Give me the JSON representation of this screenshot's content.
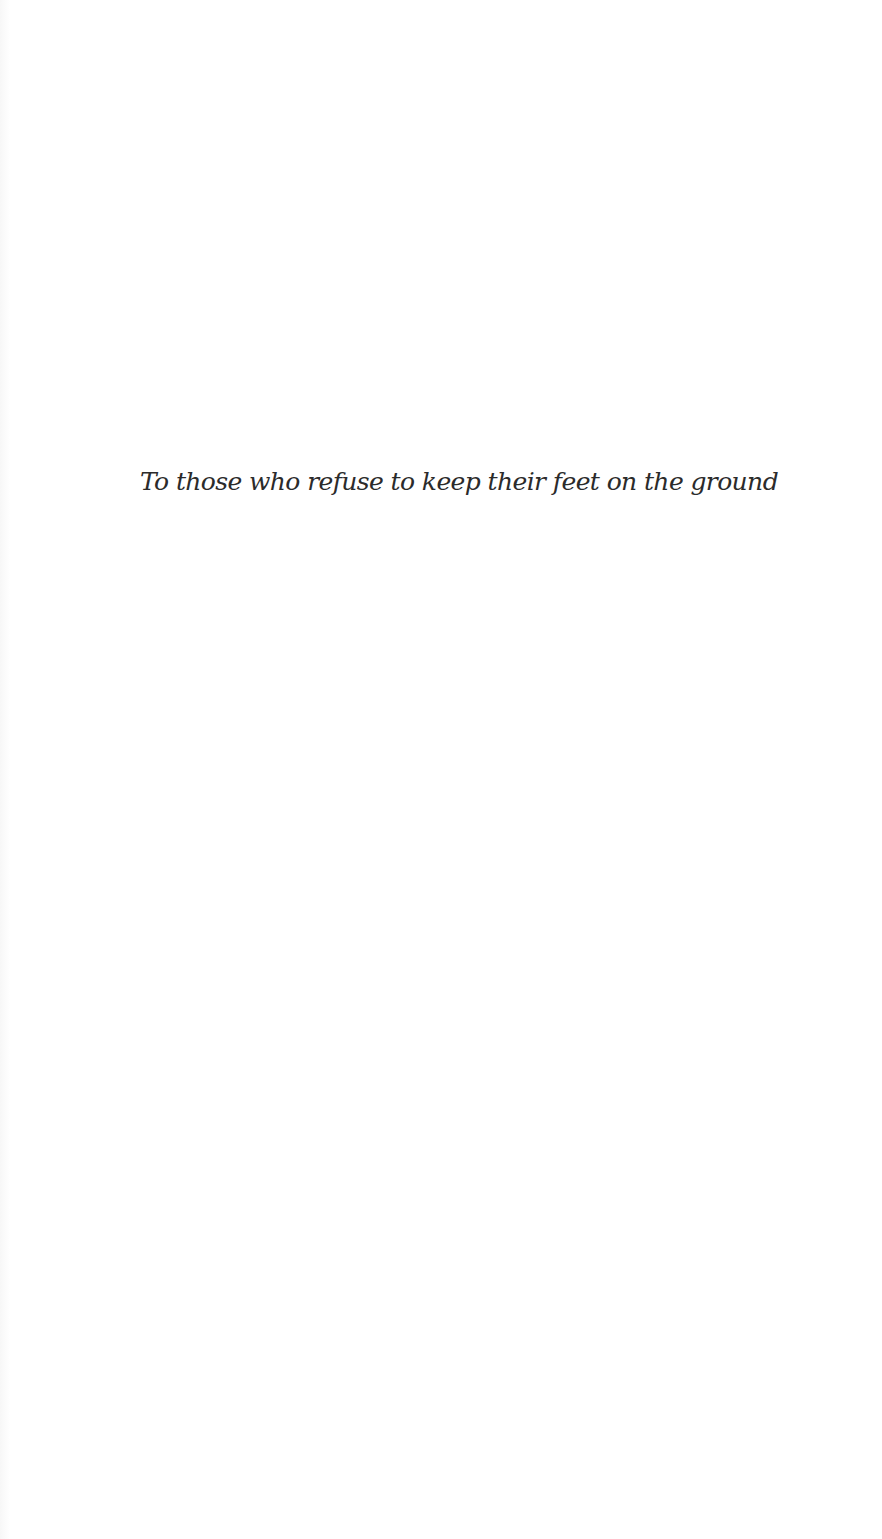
{
  "page": {
    "type": "dedication",
    "dedication_text": "To those who refuse to keep their feet on the ground",
    "colors": {
      "background": "#ffffff",
      "text": "#2b2b2b"
    }
  }
}
